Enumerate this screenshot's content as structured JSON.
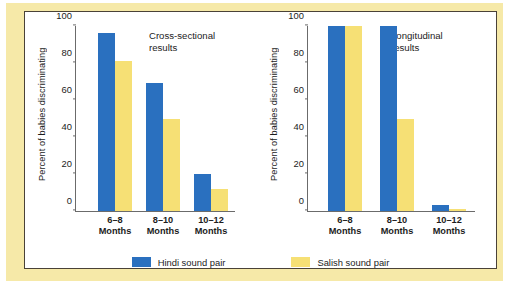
{
  "chart_data": [
    {
      "type": "bar",
      "title": "Cross-sectional\nresults",
      "xlabel": "",
      "ylabel": "Percent of babies discriminating",
      "ylim": [
        0,
        100
      ],
      "yticks": [
        "0",
        "20",
        "40",
        "60",
        "80",
        "100"
      ],
      "grid": false,
      "legend_position": "bottom-center",
      "categories": [
        "6–8\nMonths",
        "8–10\nMonths",
        "10–12\nMonths"
      ],
      "series": [
        {
          "name": "Hindi sound pair",
          "color": "#2a70bf",
          "values": [
            96,
            69,
            20
          ]
        },
        {
          "name": "Salish sound pair",
          "color": "#f6e075",
          "values": [
            81,
            50,
            12
          ]
        }
      ]
    },
    {
      "type": "bar",
      "title": "Longitudinal\nresults",
      "xlabel": "",
      "ylabel": "Percent of babies discriminating",
      "ylim": [
        0,
        100
      ],
      "yticks": [
        "0",
        "20",
        "40",
        "60",
        "80",
        "100"
      ],
      "grid": false,
      "legend_position": "bottom-center",
      "categories": [
        "6–8\nMonths",
        "8–10\nMonths",
        "10–12\nMonths"
      ],
      "series": [
        {
          "name": "Hindi sound pair",
          "color": "#2a70bf",
          "values": [
            100,
            100,
            3
          ]
        },
        {
          "name": "Salish sound pair",
          "color": "#f6e075",
          "values": [
            100,
            50,
            1
          ]
        }
      ]
    }
  ],
  "legend": {
    "items": [
      {
        "label": "Hindi sound pair",
        "color": "#2a70bf"
      },
      {
        "label": "Salish sound pair",
        "color": "#f6e075"
      }
    ]
  },
  "colors": {
    "hindi": "#2a70bf",
    "salish": "#f6e075",
    "frame": "#f6e9a8",
    "axis": "#6b6b6b",
    "text": "#1c1c1c"
  }
}
